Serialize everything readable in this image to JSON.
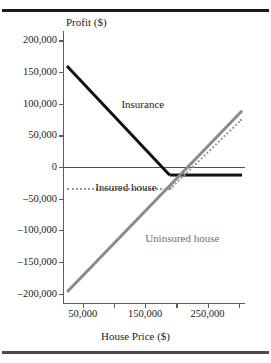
{
  "figure": {
    "background": "#ffffff",
    "rules": {
      "top": true,
      "bottom": true
    }
  },
  "chart_data": {
    "type": "line",
    "title": "",
    "xlabel": "House Price ($)",
    "ylabel": "Profit ($)",
    "xlim": [
      20000,
      310000
    ],
    "ylim": [
      -215000,
      215000
    ],
    "grid": false,
    "legend": "inline-annotations",
    "yticks": [
      200000,
      150000,
      100000,
      50000,
      0,
      -50000,
      -100000,
      -150000,
      -200000
    ],
    "ytick_labels": [
      "200,000",
      "150,000",
      "100,000",
      "50,000",
      "0",
      "–50,000",
      "–100,000",
      "–150,000",
      "–200,000"
    ],
    "xticks": [
      50000,
      100000,
      150000,
      200000,
      250000,
      300000
    ],
    "xtick_labels": [
      "50,000",
      "",
      "150,000",
      "",
      "250,000",
      ""
    ],
    "series": [
      {
        "name": "Insurance",
        "style": "solid",
        "color": "#111111",
        "width": "thick",
        "points": [
          {
            "x": 25000,
            "y": 160000
          },
          {
            "x": 190000,
            "y": -13000
          },
          {
            "x": 305000,
            "y": -13000
          }
        ]
      },
      {
        "name": "Uninsured house",
        "style": "solid",
        "color": "#8a8a8a",
        "width": "thick",
        "points": [
          {
            "x": 25000,
            "y": -198000
          },
          {
            "x": 305000,
            "y": 88000
          }
        ]
      },
      {
        "name": "Insured house",
        "style": "dotted",
        "color": "#9a9a9a",
        "width": "medium",
        "points": [
          {
            "x": 25000,
            "y": -35000
          },
          {
            "x": 190000,
            "y": -35000
          },
          {
            "x": 305000,
            "y": 75000
          }
        ]
      }
    ],
    "reference_lines": [
      {
        "name": "zero-line",
        "axis": "y",
        "value": 0,
        "color": "#4f4f4f"
      }
    ],
    "annotations": [
      {
        "text": "Insurance",
        "x": 112000,
        "y": 108000
      },
      {
        "text": "Insured house",
        "x": 70000,
        "y": -23000
      },
      {
        "text": "Uninsured house",
        "x": 150000,
        "y": -105000
      }
    ]
  }
}
